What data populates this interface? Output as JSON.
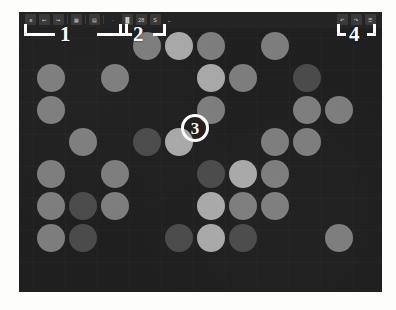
{
  "window": {
    "background_color": "#1b1b1b",
    "board_color": "#1f1f1f"
  },
  "toolbar": {
    "background_color": "#242424",
    "left_group": [
      {
        "name": "menu-icon",
        "glyph": "≡"
      },
      {
        "name": "undo-icon",
        "glyph": "↩"
      },
      {
        "name": "redo-icon",
        "glyph": "↪"
      },
      {
        "name": "separator-1",
        "glyph": ""
      },
      {
        "name": "grid-icon",
        "glyph": "▦"
      },
      {
        "name": "separator-2",
        "glyph": ""
      },
      {
        "name": "layers-icon",
        "glyph": "▤"
      },
      {
        "name": "separator-3",
        "glyph": ""
      },
      {
        "name": "more-icon",
        "glyph": "·"
      }
    ],
    "mid_group": [
      {
        "name": "align-icon",
        "glyph": "▐▌"
      },
      {
        "name": "count-badge",
        "glyph": "28"
      },
      {
        "name": "select-icon",
        "glyph": "S"
      },
      {
        "name": "chevron-down-icon",
        "glyph": "⌄"
      }
    ],
    "right_group": [
      {
        "name": "back-icon",
        "glyph": "↶"
      },
      {
        "name": "forward-icon",
        "glyph": "↷"
      },
      {
        "name": "settings-icon",
        "glyph": "☰"
      }
    ]
  },
  "annotations": {
    "callouts": [
      {
        "label": "1",
        "kind": "bracket-pair",
        "target": "left-toolbar-group"
      },
      {
        "label": "2",
        "kind": "bracket-pair",
        "target": "middle-toolbar-group"
      },
      {
        "label": "3",
        "kind": "circle",
        "target": "board-center-tile"
      },
      {
        "label": "4",
        "kind": "bracket-pair",
        "target": "right-toolbar-group"
      }
    ]
  },
  "palette": {
    "empty": "#232323",
    "dark": "#4b4b4b",
    "medium": "#7d7d7d",
    "light": "#a8a8a8"
  },
  "board": {
    "columns": 11,
    "rows": 8,
    "cell_size": 32,
    "circle_size": 28,
    "origin_x": 18,
    "origin_y": 4,
    "legend": {
      "0": "empty",
      "1": "dark",
      "2": "medium",
      "3": "light"
    },
    "grid": [
      [
        0,
        0,
        0,
        2,
        3,
        2,
        0,
        2,
        0,
        0,
        0
      ],
      [
        2,
        0,
        2,
        0,
        0,
        3,
        2,
        0,
        1,
        0,
        0
      ],
      [
        2,
        0,
        0,
        0,
        0,
        2,
        0,
        0,
        2,
        2,
        0
      ],
      [
        0,
        2,
        0,
        1,
        3,
        0,
        0,
        2,
        2,
        0,
        0
      ],
      [
        2,
        0,
        2,
        0,
        0,
        1,
        3,
        2,
        0,
        0,
        0
      ],
      [
        2,
        1,
        2,
        0,
        0,
        3,
        2,
        2,
        0,
        0,
        0
      ],
      [
        2,
        1,
        0,
        0,
        1,
        3,
        1,
        0,
        0,
        2,
        0
      ],
      [
        0,
        0,
        0,
        0,
        0,
        0,
        0,
        0,
        0,
        0,
        0
      ]
    ]
  }
}
